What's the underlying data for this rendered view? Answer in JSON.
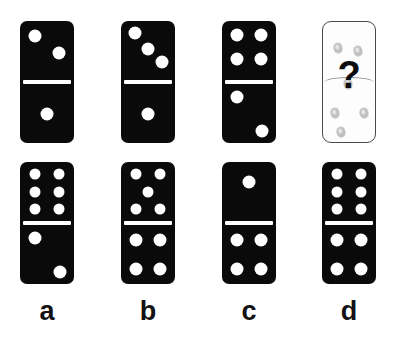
{
  "colors": {
    "tile": "#0a0a0a",
    "pip": "#ffffff",
    "background": "#ffffff",
    "mystery_tile": "#fdfdfd",
    "mystery_outline": "#4a4a4a",
    "ghost_pip": "#9a9a9a",
    "label": "#121212"
  },
  "question_mark": "?",
  "sequence": {
    "name": "sequence-row",
    "tiles": [
      {
        "id": "seq-1",
        "top_value": 2,
        "bottom_value": 1,
        "mystery": false,
        "top_pips": [
          [
            28,
            25
          ],
          [
            72,
            55
          ]
        ],
        "bottom_pips": [
          [
            50,
            50
          ]
        ]
      },
      {
        "id": "seq-2",
        "top_value": 3,
        "bottom_value": 1,
        "mystery": false,
        "top_pips": [
          [
            26,
            21
          ],
          [
            50,
            47
          ],
          [
            75,
            70
          ]
        ],
        "bottom_pips": [
          [
            50,
            50
          ]
        ]
      },
      {
        "id": "seq-3",
        "top_value": 4,
        "bottom_value": 2,
        "mystery": false,
        "top_pips": [
          [
            28,
            24
          ],
          [
            72,
            24
          ],
          [
            28,
            64
          ],
          [
            72,
            64
          ]
        ],
        "bottom_pips": [
          [
            28,
            22
          ],
          [
            74,
            80
          ]
        ]
      },
      {
        "id": "seq-4",
        "top_value": null,
        "bottom_value": null,
        "mystery": true,
        "ghost_pips": [
          [
            28,
            22
          ],
          [
            68,
            24
          ],
          [
            48,
            52
          ],
          [
            24,
            76
          ],
          [
            78,
            76
          ],
          [
            34,
            92
          ]
        ],
        "label": "?"
      }
    ]
  },
  "options": {
    "name": "answer-options-row",
    "tiles": [
      {
        "id": "option-a",
        "letter": "a",
        "top_value": 6,
        "bottom_value": 2,
        "top_pips": [
          [
            27,
            20
          ],
          [
            73,
            20
          ],
          [
            27,
            50
          ],
          [
            73,
            50
          ],
          [
            27,
            80
          ],
          [
            73,
            80
          ]
        ],
        "bottom_pips": [
          [
            28,
            22
          ],
          [
            74,
            80
          ]
        ]
      },
      {
        "id": "option-b",
        "letter": "b",
        "top_value": 5,
        "bottom_value": 4,
        "top_pips": [
          [
            27,
            20
          ],
          [
            73,
            20
          ],
          [
            50,
            50
          ],
          [
            27,
            80
          ],
          [
            73,
            80
          ]
        ],
        "bottom_pips": [
          [
            28,
            26
          ],
          [
            72,
            26
          ],
          [
            28,
            74
          ],
          [
            72,
            74
          ]
        ]
      },
      {
        "id": "option-c",
        "letter": "c",
        "top_value": 1,
        "bottom_value": 4,
        "top_pips": [
          [
            50,
            34
          ]
        ],
        "bottom_pips": [
          [
            28,
            26
          ],
          [
            72,
            26
          ],
          [
            28,
            74
          ],
          [
            72,
            74
          ]
        ]
      },
      {
        "id": "option-d",
        "letter": "d",
        "top_value": 6,
        "bottom_value": 4,
        "top_pips": [
          [
            27,
            20
          ],
          [
            73,
            20
          ],
          [
            27,
            50
          ],
          [
            73,
            50
          ],
          [
            27,
            80
          ],
          [
            73,
            80
          ]
        ],
        "bottom_pips": [
          [
            28,
            26
          ],
          [
            72,
            26
          ],
          [
            28,
            74
          ],
          [
            72,
            74
          ]
        ]
      }
    ]
  },
  "geometry": {
    "tile_width": 54,
    "tile_height": 122,
    "row_top_y": 21,
    "row_bottom_y": 162,
    "columns_x": [
      20,
      121,
      222,
      322
    ],
    "label_y": 298,
    "pip_diameter": 13,
    "pip_diameter_small": 11
  }
}
